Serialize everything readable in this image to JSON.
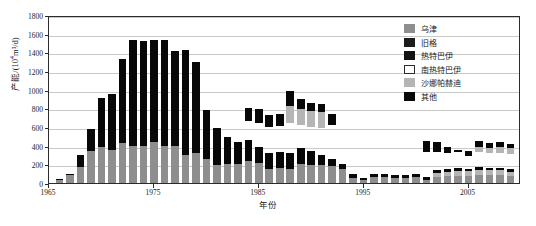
{
  "chart_data": {
    "type": "bar",
    "stacked": true,
    "title": "",
    "xlabel": "年份",
    "ylabel": "产能/(10⁴m³/d)",
    "ylabel_main": "产能/(10",
    "ylabel_sup": "4",
    "ylabel_tail": "m³/d)",
    "ylim": [
      0,
      1800
    ],
    "ytick_step": 200,
    "yticks": [
      0,
      200,
      400,
      600,
      800,
      1000,
      1200,
      1400,
      1600,
      1800
    ],
    "xlim": [
      1965,
      2010
    ],
    "xticks": [
      1965,
      1975,
      1985,
      1995,
      2005
    ],
    "grid": true,
    "grid_axis": "y",
    "legend_position": "top-right",
    "legend": [
      {
        "name": "乌津",
        "color": "#8e8e8e",
        "key": "wujin"
      },
      {
        "name": "旧格",
        "color": "#1b1b1b",
        "key": "jiuge"
      },
      {
        "name": "热特巴伊",
        "color": "#121212",
        "key": "rete"
      },
      {
        "name": "南热特巴伊",
        "color": "#ffffff",
        "key": "nanrete"
      },
      {
        "name": "沙娜帕赫迪",
        "color": "#b5b5b5",
        "key": "shana"
      },
      {
        "name": "其他",
        "color": "#080808",
        "key": "qita"
      }
    ],
    "categories": [
      1966,
      1967,
      1968,
      1969,
      1970,
      1971,
      1972,
      1973,
      1974,
      1975,
      1976,
      1977,
      1978,
      1979,
      1980,
      1981,
      1982,
      1983,
      1984,
      1985,
      1986,
      1987,
      1988,
      1989,
      1990,
      1991,
      1992,
      1993,
      1994,
      1995,
      1996,
      1997,
      1998,
      1999,
      2000,
      2001,
      2002,
      2003,
      2004,
      2005,
      2006,
      2007,
      2008,
      2009
    ],
    "series": [
      {
        "name": "乌津",
        "key": "wujin",
        "color": "#8e8e8e",
        "values": [
          30,
          85,
          175,
          340,
          390,
          350,
          425,
          400,
          400,
          440,
          400,
          400,
          300,
          325,
          260,
          190,
          200,
          205,
          240,
          215,
          150,
          160,
          150,
          205,
          195,
          195,
          185,
          150,
          55,
          30,
          60,
          60,
          50,
          55,
          60,
          35,
          60,
          70,
          80,
          80,
          85,
          85,
          90,
          80
        ]
      },
      {
        "name": "沙娜帕赫迪",
        "key": "shana",
        "color": "#b5b5b5",
        "values": [
          0,
          0,
          0,
          0,
          0,
          0,
          0,
          0,
          0,
          0,
          0,
          0,
          0,
          0,
          0,
          0,
          0,
          0,
          0,
          0,
          0,
          0,
          0,
          0,
          0,
          0,
          0,
          0,
          0,
          0,
          0,
          0,
          0,
          0,
          0,
          0,
          45,
          45,
          50,
          45,
          55,
          50,
          45,
          40
        ]
      },
      {
        "name": "南热特巴伊",
        "key": "nanrete",
        "color": "#ffffff",
        "values": [
          0,
          0,
          0,
          0,
          0,
          0,
          0,
          0,
          0,
          0,
          0,
          0,
          0,
          0,
          0,
          0,
          0,
          0,
          0,
          0,
          0,
          0,
          0,
          0,
          0,
          0,
          0,
          0,
          0,
          0,
          0,
          0,
          0,
          0,
          0,
          0,
          0,
          0,
          0,
          0,
          0,
          0,
          0,
          0
        ]
      },
      {
        "name": "其他",
        "key": "qita",
        "color": "#080808",
        "values": [
          10,
          15,
          120,
          235,
          525,
          600,
          905,
          1130,
          1120,
          1090,
          1135,
          1015,
          1120,
          975,
          525,
          395,
          290,
          230,
          225,
          170,
          175,
          175,
          170,
          170,
          145,
          100,
          70,
          55,
          45,
          20,
          40,
          35,
          35,
          30,
          35,
          25,
          35,
          30,
          30,
          30,
          30,
          30,
          25,
          25
        ]
      }
    ],
    "totals_note": "stacked totals peak ~1530 in 1974-1976",
    "gap_series_note": "A second detached cluster of bars (1985-1992 and 2002-2009) floats above the stacked base, representing 热特巴伊 / 南热特巴伊 / 沙娜帕赫迪 contributions.",
    "floating_bars": [
      {
        "x": 1984,
        "bottom": 660,
        "top": 800,
        "parts": [
          {
            "key": "qita",
            "from": 660,
            "to": 800
          }
        ]
      },
      {
        "x": 1985,
        "bottom": 640,
        "top": 790,
        "parts": [
          {
            "key": "qita",
            "from": 640,
            "to": 790
          }
        ]
      },
      {
        "x": 1986,
        "bottom": 600,
        "top": 730,
        "parts": [
          {
            "key": "qita",
            "from": 600,
            "to": 730
          }
        ]
      },
      {
        "x": 1987,
        "bottom": 610,
        "top": 740,
        "parts": [
          {
            "key": "qita",
            "from": 610,
            "to": 740
          }
        ]
      },
      {
        "x": 1988,
        "bottom": 640,
        "top": 990,
        "parts": [
          {
            "key": "shana",
            "from": 640,
            "to": 830
          },
          {
            "key": "qita",
            "from": 830,
            "to": 990
          }
        ]
      },
      {
        "x": 1989,
        "bottom": 620,
        "top": 900,
        "parts": [
          {
            "key": "shana",
            "from": 620,
            "to": 790
          },
          {
            "key": "qita",
            "from": 790,
            "to": 900
          }
        ]
      },
      {
        "x": 1990,
        "bottom": 600,
        "top": 860,
        "parts": [
          {
            "key": "shana",
            "from": 600,
            "to": 770
          },
          {
            "key": "qita",
            "from": 770,
            "to": 860
          }
        ]
      },
      {
        "x": 1991,
        "bottom": 590,
        "top": 845,
        "parts": [
          {
            "key": "shana",
            "from": 590,
            "to": 760
          },
          {
            "key": "qita",
            "from": 760,
            "to": 845
          }
        ]
      },
      {
        "x": 1992,
        "bottom": 620,
        "top": 740,
        "parts": [
          {
            "key": "qita",
            "from": 620,
            "to": 740
          }
        ]
      },
      {
        "x": 2001,
        "bottom": 330,
        "top": 450,
        "parts": [
          {
            "key": "qita",
            "from": 330,
            "to": 450
          }
        ]
      },
      {
        "x": 2002,
        "bottom": 330,
        "top": 440,
        "parts": [
          {
            "key": "qita",
            "from": 330,
            "to": 440
          }
        ]
      },
      {
        "x": 2003,
        "bottom": 320,
        "top": 390,
        "parts": [
          {
            "key": "qita",
            "from": 320,
            "to": 390
          }
        ]
      },
      {
        "x": 2004,
        "bottom": 330,
        "top": 350,
        "parts": [
          {
            "key": "qita",
            "from": 330,
            "to": 350
          }
        ]
      },
      {
        "x": 2005,
        "bottom": 290,
        "top": 340,
        "parts": [
          {
            "key": "qita",
            "from": 290,
            "to": 340
          }
        ]
      },
      {
        "x": 2006,
        "bottom": 330,
        "top": 450,
        "parts": [
          {
            "key": "shana",
            "from": 330,
            "to": 390
          },
          {
            "key": "qita",
            "from": 390,
            "to": 450
          }
        ]
      },
      {
        "x": 2007,
        "bottom": 320,
        "top": 430,
        "parts": [
          {
            "key": "shana",
            "from": 320,
            "to": 380
          },
          {
            "key": "qita",
            "from": 380,
            "to": 430
          }
        ]
      },
      {
        "x": 2008,
        "bottom": 320,
        "top": 440,
        "parts": [
          {
            "key": "shana",
            "from": 320,
            "to": 385
          },
          {
            "key": "qita",
            "from": 385,
            "to": 440
          }
        ]
      },
      {
        "x": 2009,
        "bottom": 310,
        "top": 420,
        "parts": [
          {
            "key": "shana",
            "from": 310,
            "to": 370
          },
          {
            "key": "qita",
            "from": 370,
            "to": 420
          }
        ]
      }
    ]
  }
}
